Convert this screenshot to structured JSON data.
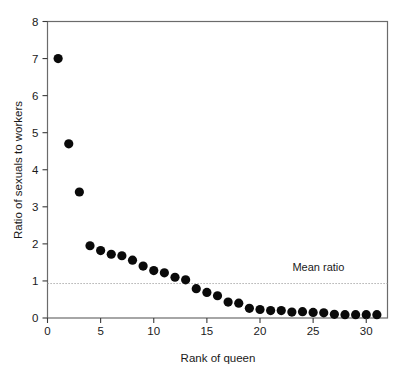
{
  "chart_data": {
    "type": "scatter",
    "title": "",
    "xlabel": "Rank of queen",
    "ylabel": "Ratio of sexuals to workers",
    "xlim": [
      0,
      32
    ],
    "ylim": [
      0,
      8
    ],
    "grid": false,
    "legend": null,
    "xticks": [
      0,
      5,
      10,
      15,
      20,
      25,
      30
    ],
    "xticklabels": [
      "0",
      "5",
      "10",
      "15",
      "20",
      "25",
      "30"
    ],
    "yticks": [
      0,
      1,
      2,
      3,
      4,
      5,
      6,
      7,
      8
    ],
    "yticklabels": [
      "0",
      "1",
      "2",
      "3",
      "4",
      "5",
      "6",
      "7",
      "8"
    ],
    "marker": "filled-circle",
    "marker_color": "#0a0a0a",
    "series": [
      {
        "name": "Ratio of sexuals to workers",
        "x": [
          1,
          2,
          3,
          4,
          5,
          6,
          7,
          8,
          9,
          10,
          11,
          12,
          13,
          14,
          15,
          16,
          17,
          18,
          19,
          20,
          21,
          22,
          23,
          24,
          25,
          26,
          27,
          28,
          29,
          30,
          31
        ],
        "values": [
          7.0,
          4.7,
          3.4,
          1.95,
          1.82,
          1.72,
          1.68,
          1.56,
          1.4,
          1.28,
          1.22,
          1.1,
          1.03,
          0.79,
          0.69,
          0.6,
          0.43,
          0.4,
          0.26,
          0.23,
          0.2,
          0.2,
          0.16,
          0.17,
          0.15,
          0.14,
          0.1,
          0.09,
          0.09,
          0.09,
          0.09
        ]
      }
    ],
    "annotations": [
      {
        "id": "mean-ratio",
        "label": "Mean ratio",
        "type": "hline",
        "y": 0.93,
        "style": "dotted",
        "color": "#9a9a9a",
        "label_x": 25.5,
        "label_y": 1.28
      }
    ]
  },
  "figure": {
    "background": "#ffffff",
    "frame_color": "#6b6b6b"
  }
}
